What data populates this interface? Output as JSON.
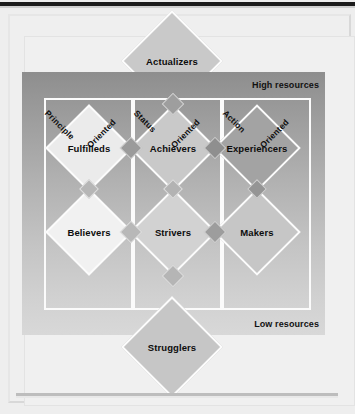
{
  "diagram": {
    "resources": {
      "high": "High resources",
      "low": "Low resources"
    },
    "orientations": [
      {
        "id": "principle",
        "word1": "Principle",
        "word2": "Oriented"
      },
      {
        "id": "status",
        "word1": "Status",
        "word2": "Oriented"
      },
      {
        "id": "action",
        "word1": "Action",
        "word2": "Oriented"
      }
    ],
    "apex": {
      "top": "Actualizers",
      "bottom": "Strugglers"
    },
    "segments": [
      {
        "id": "fulfilleds",
        "label": "Fulfilleds",
        "column": "principle",
        "row": "upper"
      },
      {
        "id": "achievers",
        "label": "Achievers",
        "column": "status",
        "row": "upper"
      },
      {
        "id": "experiencers",
        "label": "Experiencers",
        "column": "action",
        "row": "upper"
      },
      {
        "id": "believers",
        "label": "Believers",
        "column": "principle",
        "row": "lower"
      },
      {
        "id": "strivers",
        "label": "Strivers",
        "column": "status",
        "row": "lower"
      },
      {
        "id": "makers",
        "label": "Makers",
        "column": "action",
        "row": "lower"
      }
    ],
    "colors": {
      "panel_top": "#8e8e8e",
      "panel_bottom": "#d8d8d8",
      "diamond_light": "#ededed",
      "diamond_mid": "#c9c9c9",
      "diamond_dark": "#a3a3a3",
      "node": "#9e9e9e",
      "border": "#fcfcfc",
      "text": "#0d0d0d",
      "page": "#eeeeee",
      "rule": "#1c1c1c"
    }
  }
}
